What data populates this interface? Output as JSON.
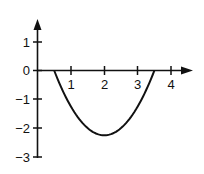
{
  "chart_data": {
    "type": "line",
    "title": "",
    "xlabel": "",
    "ylabel": "",
    "x_ticks": [
      "1",
      "2",
      "3",
      "4"
    ],
    "y_ticks": [
      "1",
      "0",
      "−1",
      "−2",
      "−3"
    ],
    "xlim": [
      0,
      4.6
    ],
    "ylim": [
      -3,
      1.6
    ],
    "grid": false,
    "legend": null,
    "series": [
      {
        "name": "curve",
        "x": [
          0.5,
          0.75,
          1.0,
          1.25,
          1.5,
          1.75,
          2.0,
          2.25,
          2.5,
          2.75,
          3.0,
          3.25,
          3.5
        ],
        "values": [
          0,
          -0.6875,
          -1.25,
          -1.6875,
          -2.0,
          -2.1875,
          -2.25,
          -2.1875,
          -2.0,
          -1.6875,
          -1.25,
          -0.6875,
          0
        ]
      }
    ],
    "annotations": []
  },
  "labels": {
    "y1": "1",
    "y0": "0",
    "ym1": "−1",
    "ym2": "−2",
    "ym3": "−3",
    "x1": "1",
    "x2": "2",
    "x3": "3",
    "x4": "4"
  },
  "colors": {
    "ink": "#111111",
    "background": "#ffffff"
  }
}
